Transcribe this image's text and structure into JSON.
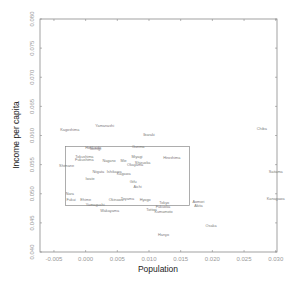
{
  "chart_data": {
    "type": "scatter",
    "title": "",
    "xlabel": "Population",
    "ylabel": "Income per capita",
    "xlim": [
      -0.0072,
      0.0302
    ],
    "ylim": [
      0.04,
      0.08
    ],
    "xticks": [
      "-0.005",
      "0.000",
      "0.005",
      "0.010",
      "0.015",
      "0.020",
      "0.025",
      "0.030"
    ],
    "yticks": [
      "0.040",
      "0.045",
      "0.050",
      "0.055",
      "0.060",
      "0.065",
      "0.070",
      "0.075",
      "0.080"
    ],
    "grid": false,
    "legend": null,
    "marker": "text-label",
    "points": [
      {
        "label": "Kagoshima",
        "x": -0.0025,
        "y": 0.061
      },
      {
        "label": "Yamanashi",
        "x": 0.003,
        "y": 0.0616
      },
      {
        "label": "Ibaraki",
        "x": 0.01,
        "y": 0.0602
      },
      {
        "label": "Chiba",
        "x": 0.0278,
        "y": 0.0612
      },
      {
        "label": "Gunma",
        "x": 0.0083,
        "y": 0.0581
      },
      {
        "label": "Hokkaido",
        "x": 0.0012,
        "y": 0.0579
      },
      {
        "label": "Tochigi",
        "x": 0.0015,
        "y": 0.0578
      },
      {
        "label": "Tokushima",
        "x": -0.0002,
        "y": 0.0564
      },
      {
        "label": "Fukushima",
        "x": -0.0002,
        "y": 0.0559
      },
      {
        "label": "Miyagi",
        "x": 0.0081,
        "y": 0.0563
      },
      {
        "label": "Hiroshima",
        "x": 0.0136,
        "y": 0.0562
      },
      {
        "label": "Nagano",
        "x": 0.0037,
        "y": 0.0557
      },
      {
        "label": "Mie",
        "x": 0.006,
        "y": 0.0556
      },
      {
        "label": "Shizuoka",
        "x": 0.009,
        "y": 0.0553
      },
      {
        "label": "Okayama",
        "x": 0.0078,
        "y": 0.055
      },
      {
        "label": "Shimane",
        "x": -0.003,
        "y": 0.0548
      },
      {
        "label": "Niigata",
        "x": 0.002,
        "y": 0.0537
      },
      {
        "label": "Ishikawa",
        "x": 0.0045,
        "y": 0.0537
      },
      {
        "label": "Kagawa",
        "x": 0.006,
        "y": 0.0534
      },
      {
        "label": "Iwate",
        "x": 0.0007,
        "y": 0.0525
      },
      {
        "label": "Gifu",
        "x": 0.0075,
        "y": 0.052
      },
      {
        "label": "Aichi",
        "x": 0.0082,
        "y": 0.0512
      },
      {
        "label": "Saitama",
        "x": 0.03,
        "y": 0.0537
      },
      {
        "label": "Nara",
        "x": -0.0025,
        "y": 0.05
      },
      {
        "label": "Fukui",
        "x": -0.0023,
        "y": 0.049
      },
      {
        "label": "Ehime",
        "x": 0.0,
        "y": 0.0489
      },
      {
        "label": "Okinawa",
        "x": 0.0048,
        "y": 0.049
      },
      {
        "label": "Toyama",
        "x": 0.0066,
        "y": 0.0491
      },
      {
        "label": "Hyogo",
        "x": 0.0094,
        "y": 0.0489
      },
      {
        "label": "Tokyo",
        "x": 0.0124,
        "y": 0.0484
      },
      {
        "label": "Yamaguchi",
        "x": 0.0015,
        "y": 0.0482
      },
      {
        "label": "Fukuoka",
        "x": 0.0122,
        "y": 0.0478
      },
      {
        "label": "Tottori",
        "x": 0.0104,
        "y": 0.0472
      },
      {
        "label": "Kumamoto",
        "x": 0.0123,
        "y": 0.047
      },
      {
        "label": "Aomori",
        "x": 0.0178,
        "y": 0.0486
      },
      {
        "label": "Akita",
        "x": 0.0178,
        "y": 0.0479
      },
      {
        "label": "Wakayama",
        "x": 0.0038,
        "y": 0.0471
      },
      {
        "label": "Kanagawa",
        "x": 0.03,
        "y": 0.0492
      },
      {
        "label": "Osaka",
        "x": 0.0198,
        "y": 0.0446
      },
      {
        "label": "Hanyo",
        "x": 0.0123,
        "y": 0.043
      }
    ],
    "inset_box": {
      "x0": -0.0032,
      "x1": 0.0164,
      "y0": 0.048,
      "y1": 0.0581
    }
  }
}
